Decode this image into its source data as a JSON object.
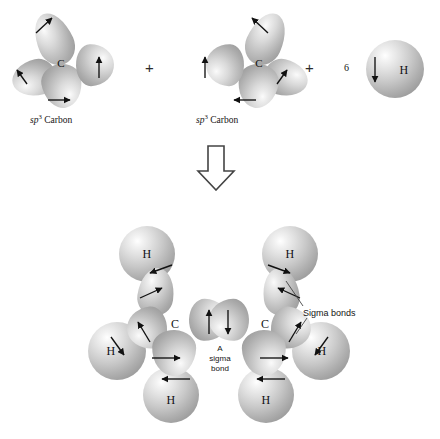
{
  "figure": {
    "background_color": "#ffffff",
    "sphere_color": "#c0c0c0",
    "label_color": "#141414"
  },
  "reaction": {
    "operator_plus": "+",
    "transform_arrow": "down-block-arrow",
    "hydrogen_count": "6",
    "reactants": [
      {
        "id": "sp3-carbon-left",
        "center_label": "C",
        "caption_prefix": "sp",
        "caption_sup": "3",
        "caption_suffix": " Carbon"
      },
      {
        "id": "sp3-carbon-right",
        "center_label": "C",
        "caption_prefix": "sp",
        "caption_sup": "3",
        "caption_suffix": " Carbon"
      },
      {
        "id": "hydrogen-atom",
        "count": "6",
        "center_label": "H"
      }
    ]
  },
  "product": {
    "id": "ethane-molecule",
    "carbon_left_label": "C",
    "carbon_right_label": "C",
    "hydrogen_labels": [
      "H",
      "H",
      "H",
      "H",
      "H",
      "H"
    ],
    "annotations": [
      {
        "id": "sigma-bonds-callout",
        "text": "Sigma bonds"
      },
      {
        "id": "a-sigma-bond-callout",
        "text": "A\nsigma\nbond"
      }
    ]
  },
  "caption": {
    "text": ""
  }
}
